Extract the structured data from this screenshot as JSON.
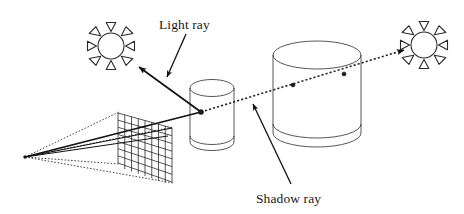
{
  "figure": {
    "background_color": "#ffffff",
    "line_color": "#1a1a1a",
    "width": 464,
    "height": 214
  },
  "labels": {
    "light_ray": "Light ray",
    "shadow_ray": "Shadow ray"
  },
  "scene": {
    "eye_point": {
      "name": "eye-point",
      "x": 25,
      "y": 157
    },
    "image_plane": {
      "name": "image-plane-grid",
      "columns": 8,
      "rows": 7,
      "top_left": {
        "x": 118,
        "y": 113
      },
      "top_right": {
        "x": 172,
        "y": 128
      },
      "bottom_right": {
        "x": 172,
        "y": 182
      },
      "bottom_left": {
        "x": 118,
        "y": 163
      }
    },
    "suns": [
      {
        "name": "light-source-left",
        "cx": 111,
        "cy": 46,
        "r": 13,
        "spikes": 8
      },
      {
        "name": "light-source-right",
        "cx": 424,
        "cy": 45,
        "r": 13,
        "spikes": 8
      }
    ],
    "cylinders": [
      {
        "name": "small-cylinder",
        "cx": 212,
        "rx": 22,
        "top_y": 88,
        "bottom_y": 142,
        "ry": 9
      },
      {
        "name": "large-cylinder",
        "cx": 317,
        "rx": 44,
        "top_y": 55,
        "bottom_y": 133,
        "ry": 14
      }
    ],
    "intersection_points": [
      {
        "name": "primary-hit-point",
        "x": 201,
        "y": 112
      },
      {
        "name": "shadow-entry-point",
        "x": 293,
        "y": 85
      },
      {
        "name": "shadow-exit-point",
        "x": 344,
        "y": 74
      }
    ],
    "rays": [
      {
        "name": "eye-ray",
        "style": "solid",
        "from": {
          "x": 25,
          "y": 157
        },
        "to": {
          "x": 201,
          "y": 112
        }
      },
      {
        "name": "light-ray-to-left-sun",
        "style": "solid-arrow",
        "from": {
          "x": 201,
          "y": 112
        },
        "to": {
          "x": 138,
          "y": 66
        }
      },
      {
        "name": "shadow-ray-to-right-sun",
        "style": "dotted-arrow",
        "from": {
          "x": 201,
          "y": 112
        },
        "to": {
          "x": 407,
          "y": 49
        }
      }
    ],
    "leaders": [
      {
        "name": "light-ray-leader",
        "from": {
          "x": 186,
          "y": 34
        },
        "to": {
          "x": 166,
          "y": 79
        }
      },
      {
        "name": "shadow-ray-leader",
        "from": {
          "x": 291,
          "y": 184
        },
        "to": {
          "x": 252,
          "y": 102
        }
      }
    ]
  }
}
